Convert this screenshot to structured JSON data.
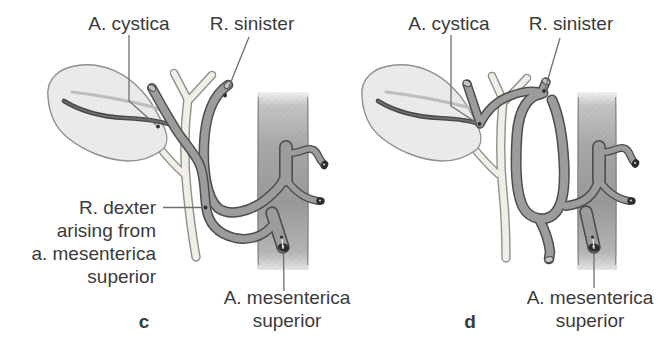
{
  "figure": {
    "type": "anatomical-diagram",
    "colors": {
      "background": "#ffffff",
      "vessel_gray": "#9c9c9c",
      "vessel_outline": "#4d4d4d",
      "cut_end_dark": "#2d2d2d",
      "outline_gray": "#8f8f8f",
      "gallbladder_fill": "#ececec",
      "duct_fill": "#f3f1e9",
      "band_gray": "#a2a2a2",
      "text_color": "#3b3b3b",
      "leader_color": "#6f6f6f"
    },
    "panels": [
      {
        "letter": "c",
        "labels": {
          "a_cystica": "A. cystica",
          "r_sinister": "R. sinister",
          "r_dexter": [
            "R. dexter",
            "arising from",
            "a. mesenterica",
            "superior"
          ],
          "a_mesenterica": [
            "A. mesenterica",
            "superior"
          ]
        }
      },
      {
        "letter": "d",
        "labels": {
          "a_cystica": "A. cystica",
          "r_sinister": "R. sinister",
          "a_mesenterica": [
            "A. mesenterica",
            "superior"
          ]
        }
      }
    ]
  }
}
